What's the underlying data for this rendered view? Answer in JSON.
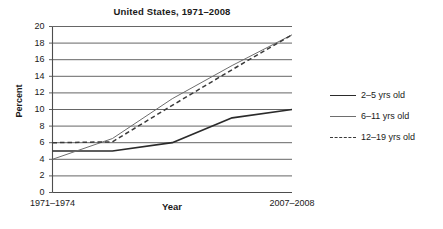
{
  "chart_data": {
    "type": "line",
    "title": "United States, 1971–2008",
    "xlabel": "Year",
    "ylabel": "Percent",
    "ylim": [
      0,
      20
    ],
    "ytick_step": 2,
    "grid": true,
    "legend_position": "right",
    "categories": [
      "1971–1974",
      "1976–1980",
      "1988–1994",
      "1999–2002",
      "2007–2008"
    ],
    "xtick_labels_shown": [
      "1971–1974",
      "2007–2008"
    ],
    "yticks": [
      0,
      2,
      4,
      6,
      8,
      10,
      12,
      14,
      16,
      18,
      20
    ],
    "series": [
      {
        "name": "2–5 yrs old",
        "style": "solid-thick",
        "color": "#2b2b2b",
        "values": [
          5,
          5,
          6,
          9,
          10
        ]
      },
      {
        "name": "6–11 yrs old",
        "style": "solid-thin",
        "color": "#6e6e6e",
        "values": [
          4,
          6.5,
          11.3,
          15.3,
          19
        ]
      },
      {
        "name": "12–19 yrs old",
        "style": "dashed",
        "color": "#3a3a3a",
        "values": [
          6,
          6.1,
          10.5,
          14.8,
          19
        ]
      }
    ]
  },
  "legend": {
    "items": [
      {
        "label": "2–5 yrs old"
      },
      {
        "label": "6–11 yrs old"
      },
      {
        "label": "12–19 yrs old"
      }
    ]
  },
  "colors": {
    "axis": "#4d4d4d",
    "grid": "#555555",
    "text": "#1a1a1a",
    "background": "#ffffff"
  }
}
